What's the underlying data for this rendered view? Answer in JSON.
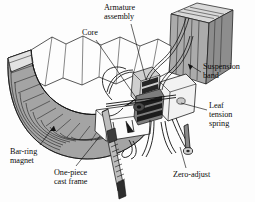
{
  "figure": {
    "type": "technical-cutaway-diagram",
    "background_color": "#fdfdfd",
    "line_color": "#111111",
    "fill_gray_light": "#d8d8d8",
    "fill_gray_mid": "#9d9d9d",
    "fill_gray_dark": "#6a6a6a",
    "fill_white": "#fbfbfb"
  },
  "labels": [
    {
      "id": "armature-assembly",
      "text": "Armature\nassembly",
      "x": 104,
      "y": 3,
      "anchor": "start"
    },
    {
      "id": "core",
      "text": "Core",
      "x": 82,
      "y": 28,
      "anchor": "start"
    },
    {
      "id": "suspension-band",
      "text": "Suspension\nband",
      "x": 203,
      "y": 62,
      "anchor": "start"
    },
    {
      "id": "leaf-tension-spring",
      "text": "Leaf\ntension\nspring",
      "x": 209,
      "y": 101,
      "anchor": "start"
    },
    {
      "id": "bar-ring-magnet",
      "text": "Bar-ring\nmagnet",
      "x": 10,
      "y": 147,
      "anchor": "start"
    },
    {
      "id": "one-piece-cast-frame",
      "text": "One-piece\ncast frame",
      "x": 54,
      "y": 168,
      "anchor": "start"
    },
    {
      "id": "zero-adjust",
      "text": "Zero-adjust",
      "x": 173,
      "y": 170,
      "anchor": "start"
    }
  ],
  "leader_lines": [
    {
      "id": "leader-armature-assembly",
      "from": [
        131,
        24
      ],
      "to": [
        146,
        80
      ]
    },
    {
      "id": "leader-core",
      "from": [
        96,
        40
      ],
      "to": [
        137,
        99
      ]
    },
    {
      "id": "leader-suspension-band",
      "from": [
        201,
        72
      ],
      "to": [
        188,
        64
      ]
    },
    {
      "id": "leader-leaf-tension-spring",
      "from": [
        207,
        110
      ],
      "to": [
        181,
        103
      ]
    },
    {
      "id": "leader-bar-ring-magnet",
      "from": [
        40,
        145
      ],
      "to": [
        54,
        126
      ]
    },
    {
      "id": "leader-one-piece-cast-frame",
      "from": [
        76,
        166
      ],
      "to": [
        100,
        136
      ]
    },
    {
      "id": "leader-zero-adjust",
      "from": [
        186,
        168
      ],
      "to": [
        180,
        147
      ]
    }
  ]
}
